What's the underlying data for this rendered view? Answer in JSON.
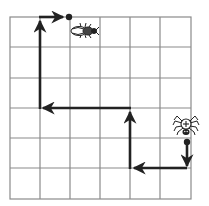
{
  "diagram": {
    "type": "grid-path",
    "grid": {
      "columns": 6,
      "rows": 6,
      "line_color": "#8a8a8a"
    },
    "path": {
      "color": "#222222",
      "start": {
        "label": "spider",
        "icon": "spider-icon"
      },
      "end": {
        "label": "beetle",
        "icon": "beetle-icon"
      },
      "moves": [
        {
          "direction": "down",
          "squares": 1
        },
        {
          "direction": "left",
          "squares": 2
        },
        {
          "direction": "up",
          "squares": 2
        },
        {
          "direction": "left",
          "squares": 3
        },
        {
          "direction": "up",
          "squares": 3
        },
        {
          "direction": "right",
          "squares": 1
        }
      ]
    }
  }
}
